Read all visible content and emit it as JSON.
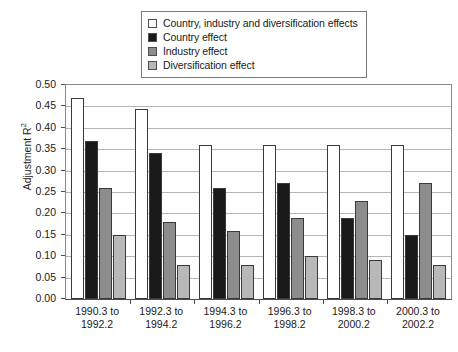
{
  "chart_data": {
    "type": "bar",
    "title": "",
    "xlabel": "",
    "ylabel": "Adjustment R²",
    "ylim": [
      0.0,
      0.5
    ],
    "ytick_step": 0.05,
    "grid": true,
    "legend_position": "top-center",
    "categories": [
      "1990.3 to 1992.2",
      "1992.3 to 1994.2",
      "1994.3 to 1996.2",
      "1996.3 to 1998.2",
      "1998.3 to 2000.2",
      "2000.3 to 2002.2"
    ],
    "category_lines": [
      [
        "1990.3 to",
        "1992.2"
      ],
      [
        "1992.3 to",
        "1994.2"
      ],
      [
        "1994.3 to",
        "1996.2"
      ],
      [
        "1996.3 to",
        "1998.2"
      ],
      [
        "1998.3 to",
        "2000.2"
      ],
      [
        "2000.3 to",
        "2002.2"
      ]
    ],
    "ticks": [
      "0.00",
      "0.05",
      "0.10",
      "0.15",
      "0.20",
      "0.25",
      "0.30",
      "0.35",
      "0.40",
      "0.45",
      "0.50"
    ],
    "series": [
      {
        "name": "Country, industry and diversification effects",
        "color": "#ffffff",
        "values": [
          0.47,
          0.445,
          0.36,
          0.36,
          0.36,
          0.36
        ]
      },
      {
        "name": "Country effect",
        "color": "#1a1a1a",
        "values": [
          0.37,
          0.34,
          0.26,
          0.27,
          0.19,
          0.15
        ]
      },
      {
        "name": "Industry effect",
        "color": "#8c8c8c",
        "values": [
          0.26,
          0.18,
          0.16,
          0.19,
          0.23,
          0.27
        ]
      },
      {
        "name": "Diversification effect",
        "color": "#b8b8b8",
        "values": [
          0.15,
          0.08,
          0.08,
          0.1,
          0.09,
          0.08
        ]
      }
    ]
  },
  "legend": {
    "items": [
      {
        "label": "Country, industry and diversification effects",
        "color": "#ffffff"
      },
      {
        "label": "Country effect",
        "color": "#1a1a1a"
      },
      {
        "label": "Industry effect",
        "color": "#8c8c8c"
      },
      {
        "label": "Diversification effect",
        "color": "#b8b8b8"
      }
    ]
  },
  "axis": {
    "y_title_main": "Adjustment R",
    "y_title_sup": "2"
  }
}
